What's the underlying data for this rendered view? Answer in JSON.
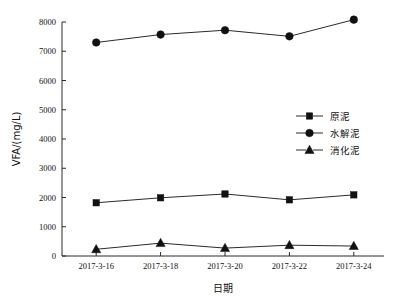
{
  "chart_data": {
    "type": "line",
    "title": "",
    "xlabel": "日期",
    "ylabel": "VFA/(mg/L)",
    "categories": [
      "2017-3-16",
      "2017-3-18",
      "2017-3-20",
      "2017-3-22",
      "2017-3-24"
    ],
    "ylim": [
      0,
      8000
    ],
    "ytick_labels": [
      "0",
      "1000",
      "2000",
      "3000",
      "4000",
      "5000",
      "6000",
      "7000",
      "8000"
    ],
    "ytick_values": [
      0,
      1000,
      2000,
      3000,
      4000,
      5000,
      6000,
      7000,
      8000
    ],
    "grid": false,
    "legend_position": "center-right",
    "series": [
      {
        "name": "原泥",
        "marker": "square",
        "color": "#111111",
        "values": [
          1820,
          1990,
          2120,
          1920,
          2090
        ]
      },
      {
        "name": "水解泥",
        "marker": "circle",
        "color": "#111111",
        "values": [
          7300,
          7570,
          7720,
          7510,
          8080
        ]
      },
      {
        "name": "消化泥",
        "marker": "triangle",
        "color": "#111111",
        "values": [
          230,
          440,
          270,
          370,
          340
        ]
      }
    ]
  },
  "axes": {
    "x_title": "日期",
    "y_title": "VFA/(mg/L)"
  },
  "legend": {
    "items": [
      {
        "label": "原泥",
        "marker": "square"
      },
      {
        "label": "水解泥",
        "marker": "circle"
      },
      {
        "label": "消化泥",
        "marker": "triangle"
      }
    ]
  }
}
